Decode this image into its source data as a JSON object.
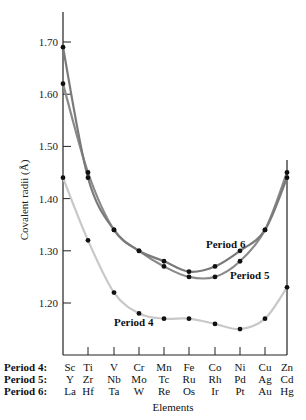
{
  "chart_data": {
    "type": "line",
    "title": "",
    "xlabel": "Elements",
    "ylabel": "Covalent radii (Å)",
    "ylim": [
      1.12,
      1.78
    ],
    "yticks": [
      "1.20",
      "1.30",
      "1.40",
      "1.50",
      "1.60",
      "1.70"
    ],
    "grid": false,
    "categories": [
      "Sc/Y/La",
      "Ti/Zr/Hf",
      "V/Nb/Ta",
      "Cr/Mo/W",
      "Mn/Tc/Re",
      "Fe/Ru/Os",
      "Co/Rh/Ir",
      "Ni/Pd/Pt",
      "Cu/Ag/Au",
      "Zn/Cd/Hg"
    ],
    "series": [
      {
        "name": "Period 4",
        "elements": [
          "Sc",
          "Ti",
          "V",
          "Cr",
          "Mn",
          "Fe",
          "Co",
          "Ni",
          "Cu",
          "Zn"
        ],
        "values": [
          1.44,
          1.32,
          1.22,
          1.18,
          1.17,
          1.17,
          1.16,
          1.15,
          1.17,
          1.23
        ],
        "color": "#c8c8c8"
      },
      {
        "name": "Period 5",
        "elements": [
          "Y",
          "Zr",
          "Nb",
          "Mo",
          "Tc",
          "Ru",
          "Rh",
          "Pd",
          "Ag",
          "Cd"
        ],
        "values": [
          1.62,
          1.45,
          1.34,
          1.3,
          1.27,
          1.25,
          1.25,
          1.28,
          1.34,
          1.45
        ],
        "color": "#8a8a8a"
      },
      {
        "name": "Period 6",
        "elements": [
          "La",
          "Hf",
          "Ta",
          "W",
          "Re",
          "Os",
          "Ir",
          "Pt",
          "Au",
          "Hg"
        ],
        "values": [
          1.69,
          1.44,
          1.34,
          1.3,
          1.28,
          1.26,
          1.27,
          1.3,
          1.34,
          1.44
        ],
        "color": "#7a7a7a"
      }
    ],
    "annotations": [
      "Period 4",
      "Period 5",
      "Period 6"
    ]
  },
  "labels": {
    "ylabel": "Covalent radii (Å)",
    "xlabel": "Elements",
    "period4": "Period 4",
    "period5": "Period 5",
    "period6": "Period 6"
  },
  "rows": [
    {
      "title": "Period 4:",
      "elements": [
        "Sc",
        "Ti",
        "V",
        "Cr",
        "Mn",
        "Fe",
        "Co",
        "Ni",
        "Cu",
        "Zn"
      ]
    },
    {
      "title": "Period 5:",
      "elements": [
        "Y",
        "Zr",
        "Nb",
        "Mo",
        "Tc",
        "Ru",
        "Rh",
        "Pd",
        "Ag",
        "Cd"
      ]
    },
    {
      "title": "Period 6:",
      "elements": [
        "La",
        "Hf",
        "Ta",
        "W",
        "Re",
        "Os",
        "Ir",
        "Pt",
        "Au",
        "Hg"
      ]
    }
  ]
}
